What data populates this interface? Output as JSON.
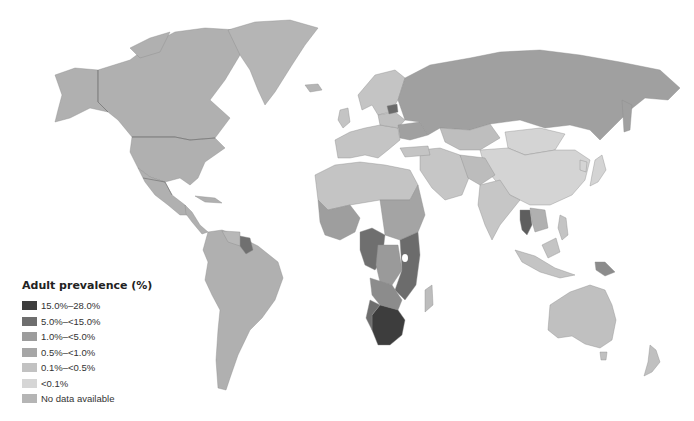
{
  "map": {
    "title": "Adult HIV prevalence world map",
    "legend": {
      "title": "Adult prevalence (%)",
      "items": [
        {
          "label": "15.0%–28.0%",
          "color": "#3d3d3d"
        },
        {
          "label": "5.0%–<15.0%",
          "color": "#6e6e6e"
        },
        {
          "label": "1.0%–<5.0%",
          "color": "#9c9c9c"
        },
        {
          "label": "0.5%–<1.0%",
          "color": "#a6a6a6"
        },
        {
          "label": "0.1%–<0.5%",
          "color": "#c2c2c2"
        },
        {
          "label": "<0.1%",
          "color": "#d6d6d6"
        },
        {
          "label": "No data available",
          "color": "#b5b5b5"
        }
      ]
    },
    "regions": [
      {
        "name": "North America",
        "category": "0.5%–<1.0%"
      },
      {
        "name": "Greenland",
        "category": "No data available"
      },
      {
        "name": "Russia",
        "category": "1.0%–<5.0%"
      },
      {
        "name": "Estonia/Latvia",
        "category": "1.0%–<5.0%"
      },
      {
        "name": "Ukraine",
        "category": "1.0%–<5.0%"
      },
      {
        "name": "Western Europe",
        "category": "0.1%–<0.5%"
      },
      {
        "name": "China",
        "category": "<0.1%"
      },
      {
        "name": "Mongolia",
        "category": "<0.1%"
      },
      {
        "name": "India",
        "category": "0.1%–<0.5%"
      },
      {
        "name": "Thailand",
        "category": "1.0%–<5.0%"
      },
      {
        "name": "Papua New Guinea",
        "category": "1.0%–<5.0%"
      },
      {
        "name": "Australia",
        "category": "0.1%–<0.5%"
      },
      {
        "name": "South America",
        "category": "0.5%–<1.0%"
      },
      {
        "name": "Guyana/Suriname",
        "category": "1.0%–<5.0%"
      },
      {
        "name": "North Africa",
        "category": "0.1%–<0.5%"
      },
      {
        "name": "West Africa",
        "category": "1.0%–<5.0%"
      },
      {
        "name": "Central Africa",
        "category": "5.0%–<15.0%"
      },
      {
        "name": "East Africa",
        "category": "5.0%–<15.0%"
      },
      {
        "name": "Southern Africa",
        "category": "15.0%–28.0%"
      },
      {
        "name": "Middle East",
        "category": "0.1%–<0.5%"
      }
    ]
  }
}
